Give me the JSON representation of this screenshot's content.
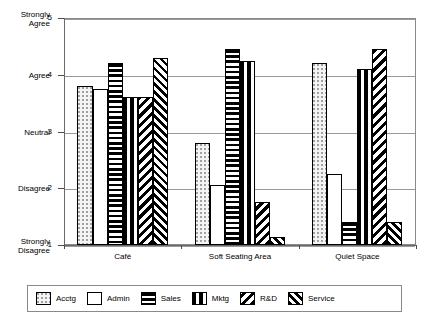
{
  "chart_data": {
    "type": "bar",
    "title": "",
    "subtitle": "",
    "xlabel": "",
    "ylabel": "",
    "categories": [
      "Café",
      "Soft Seating Area",
      "Quiet Space"
    ],
    "ylim": [
      1,
      5
    ],
    "yticks": [
      1,
      2,
      3,
      4,
      5
    ],
    "ytick_numbers": [
      "1",
      "2",
      "3",
      "4",
      "5"
    ],
    "ytick_labels": [
      "Strongly\nDisagree",
      "Disagree",
      "Neutral",
      "Agree",
      "Strongly\nAgree"
    ],
    "grid": true,
    "legend_position": "bottom",
    "series": [
      {
        "name": "Acctg",
        "pattern": "dots",
        "values": [
          3.8,
          2.8,
          4.2
        ]
      },
      {
        "name": "Admin",
        "pattern": "plain",
        "values": [
          3.75,
          2.05,
          2.25
        ]
      },
      {
        "name": "Sales",
        "pattern": "hbars",
        "values": [
          4.2,
          4.45,
          1.4
        ]
      },
      {
        "name": "Mktg",
        "pattern": "vbars",
        "values": [
          3.6,
          4.25,
          4.1
        ]
      },
      {
        "name": "R&D",
        "pattern": "diag-back",
        "values": [
          3.6,
          1.75,
          4.45
        ]
      },
      {
        "name": "Service",
        "pattern": "herring",
        "values": [
          4.3,
          1.15,
          1.4
        ]
      }
    ]
  },
  "legend": {
    "items": [
      {
        "label": "Acctg",
        "pattern": "dots"
      },
      {
        "label": "Admin",
        "pattern": "plain"
      },
      {
        "label": "Sales",
        "pattern": "hbars"
      },
      {
        "label": "Mktg",
        "pattern": "vbars"
      },
      {
        "label": "R&D",
        "pattern": "diag-back"
      },
      {
        "label": "Service",
        "pattern": "herring"
      }
    ]
  },
  "colors": {
    "ink": "#000000",
    "frame": "#8a8a8a",
    "grid": "#9a9a9a",
    "background": "#ffffff"
  }
}
